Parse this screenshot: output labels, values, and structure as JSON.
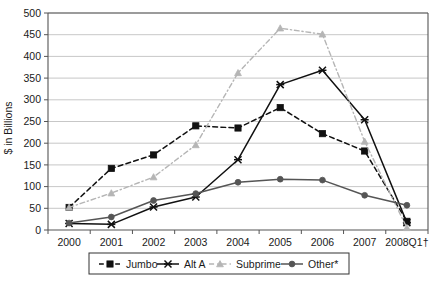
{
  "chart_data": {
    "type": "line",
    "title": "",
    "xlabel": "",
    "ylabel": "$ in Billions",
    "categories": [
      "2000",
      "2001",
      "2002",
      "2003",
      "2004",
      "2005",
      "2006",
      "2007",
      "2008Q1†"
    ],
    "ylim": [
      0,
      500
    ],
    "ytick_step": 50,
    "yticks": [
      "0",
      "50",
      "100",
      "150",
      "200",
      "250",
      "300",
      "350",
      "400",
      "450",
      "500"
    ],
    "grid": true,
    "legend_position": "bottom",
    "series": [
      {
        "name": "Jumbo",
        "color": "#111111",
        "marker": "square",
        "dash": "dashed",
        "values": [
          52,
          142,
          173,
          240,
          235,
          282,
          222,
          182,
          20
        ]
      },
      {
        "name": "Alt A",
        "color": "#111111",
        "marker": "cross",
        "dash": "solid",
        "values": [
          15,
          13,
          53,
          76,
          162,
          335,
          368,
          254,
          17
        ]
      },
      {
        "name": "Subprime",
        "color": "#b5b5b5",
        "marker": "triangle",
        "dash": "dashdot",
        "values": [
          52,
          85,
          122,
          196,
          362,
          465,
          451,
          204,
          5
        ]
      },
      {
        "name": "Other*",
        "color": "#555555",
        "marker": "circle",
        "dash": "solid",
        "values": [
          16,
          30,
          68,
          84,
          110,
          117,
          115,
          80,
          57
        ]
      }
    ]
  },
  "legend": {
    "entries": [
      {
        "label": "Jumbo"
      },
      {
        "label": "Alt A"
      },
      {
        "label": "Subprime"
      },
      {
        "label": "Other*"
      }
    ]
  },
  "axes": {
    "y_title": "$ in Billions"
  }
}
